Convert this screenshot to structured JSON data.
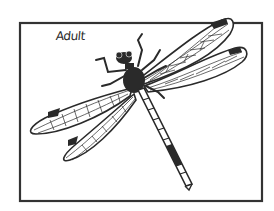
{
  "figure": {
    "label": "Adult",
    "colors": {
      "ink": "#2a2a2a",
      "frame": "#333333",
      "background": "#ffffff"
    }
  }
}
